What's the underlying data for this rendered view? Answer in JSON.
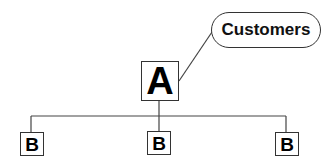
{
  "diagram": {
    "root": {
      "label": "A"
    },
    "callout": {
      "label": "Customers"
    },
    "children": [
      {
        "label": "B"
      },
      {
        "label": "B"
      },
      {
        "label": "B"
      }
    ]
  },
  "colors": {
    "stroke": "#333333",
    "text": "#000000",
    "background": "#ffffff"
  }
}
